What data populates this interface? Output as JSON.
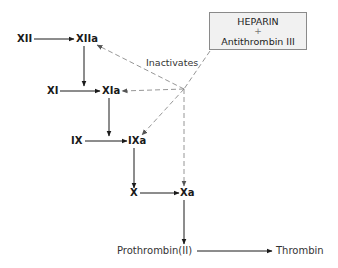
{
  "diagram": {
    "inhibitor_box": {
      "line1": "HEPARIN",
      "plus": "+",
      "line2": "Antithrombin III"
    },
    "inhibition_label": "Inactivates",
    "nodes": {
      "xii": "XII",
      "xiia": "XIIa",
      "xi": "XI",
      "xia": "XIa",
      "ix": "IX",
      "ixa": "IXa",
      "x": "X",
      "xa": "Xa",
      "prothrombin": "Prothrombin(II)",
      "thrombin": "Thrombin"
    },
    "activation_edges": [
      [
        "XII",
        "XIIa"
      ],
      [
        "XIIa",
        "XIa"
      ],
      [
        "XI",
        "XIa"
      ],
      [
        "XIa",
        "IXa"
      ],
      [
        "IX",
        "IXa"
      ],
      [
        "IXa",
        "X"
      ],
      [
        "X",
        "Xa"
      ],
      [
        "Xa",
        "Prothrombin(II)"
      ],
      [
        "Prothrombin(II)",
        "Thrombin"
      ]
    ],
    "inactivation_targets": [
      "XIIa",
      "XIa",
      "IXa",
      "Xa"
    ],
    "colors": {
      "solid_arrow": "#1a1a1a",
      "dashed_arrow": "#8a8a8a",
      "box_fill": "#f1f1f1",
      "box_border": "#8a8a8a"
    }
  }
}
